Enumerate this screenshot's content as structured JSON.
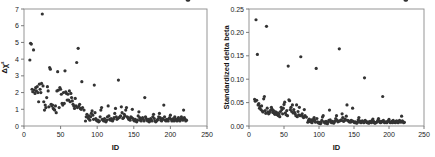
{
  "figure": {
    "background": "#ffffff",
    "marker_color": "#333333",
    "axis_color": "#6d6d6d",
    "panel_count": 2
  },
  "chart_data": [
    {
      "type": "scatter",
      "title": "",
      "xlabel": "ID",
      "ylabel": "Δχ²",
      "xlim": [
        0,
        250
      ],
      "ylim": [
        0,
        7
      ],
      "xticks": [
        0,
        50,
        100,
        150,
        200,
        250
      ],
      "yticks": [
        0,
        1,
        2,
        3,
        4,
        5,
        6,
        7
      ],
      "xtick_labels": [
        "0",
        "50",
        "100",
        "150",
        "200",
        "250"
      ],
      "ytick_labels": [
        "0",
        "1",
        "2",
        "3",
        "4",
        "5",
        "6",
        "7"
      ],
      "grid": false,
      "legend": false,
      "marker_size": 1.6,
      "marker_color": "#333333",
      "x": [
        8,
        9,
        10,
        11,
        12,
        13,
        14,
        15,
        16,
        17,
        18,
        19,
        20,
        21,
        22,
        23,
        24,
        25,
        26,
        27,
        28,
        29,
        30,
        31,
        32,
        33,
        34,
        35,
        36,
        37,
        38,
        39,
        40,
        41,
        42,
        43,
        44,
        45,
        46,
        47,
        48,
        49,
        50,
        51,
        52,
        53,
        54,
        55,
        56,
        57,
        58,
        59,
        60,
        61,
        62,
        63,
        64,
        65,
        66,
        67,
        68,
        69,
        70,
        71,
        72,
        73,
        74,
        75,
        76,
        77,
        78,
        79,
        80,
        82,
        84,
        85,
        86,
        87,
        88,
        89,
        90,
        91,
        92,
        93,
        94,
        95,
        96,
        97,
        98,
        99,
        100,
        101,
        102,
        103,
        104,
        105,
        106,
        107,
        108,
        109,
        110,
        111,
        112,
        113,
        114,
        115,
        116,
        117,
        118,
        119,
        120,
        121,
        122,
        123,
        124,
        125,
        126,
        127,
        128,
        129,
        130,
        131,
        132,
        133,
        134,
        135,
        136,
        137,
        138,
        139,
        140,
        141,
        142,
        143,
        144,
        145,
        146,
        147,
        148,
        149,
        150,
        151,
        152,
        153,
        154,
        155,
        156,
        157,
        158,
        159,
        160,
        161,
        162,
        163,
        164,
        165,
        166,
        167,
        168,
        169,
        170,
        171,
        172,
        173,
        174,
        175,
        176,
        177,
        178,
        179,
        180,
        181,
        182,
        183,
        184,
        185,
        186,
        187,
        188,
        189,
        190,
        191,
        192,
        193,
        194,
        195,
        196,
        197,
        198,
        199,
        200,
        201,
        202,
        203,
        204,
        205,
        206,
        207,
        208,
        209,
        210,
        211,
        212,
        213,
        214,
        215,
        216,
        217,
        218,
        219,
        220,
        221,
        222,
        223,
        224,
        225
      ],
      "y": [
        3.95,
        4.95,
        4.9,
        2.2,
        2.05,
        4.55,
        2.15,
        1.95,
        2.3,
        2.1,
        2.35,
        2.0,
        1.45,
        2.5,
        2.2,
        2.0,
        2.55,
        6.7,
        2.4,
        1.45,
        0.95,
        1.25,
        1.1,
        1.7,
        2.35,
        2.1,
        1.15,
        3.5,
        3.4,
        1.3,
        1.2,
        1.25,
        1.05,
        1.0,
        0.95,
        1.2,
        0.8,
        2.1,
        3.25,
        2.15,
        1.1,
        2.3,
        2.2,
        1.9,
        1.35,
        1.25,
        2.0,
        1.35,
        3.3,
        2.05,
        1.95,
        1.55,
        1.9,
        1.55,
        2.1,
        1.45,
        1.95,
        1.7,
        1.5,
        1.3,
        1.2,
        1.05,
        1.65,
        1.2,
        3.8,
        1.1,
        4.65,
        1.2,
        1.3,
        1.05,
        1.0,
        2.65,
        1.1,
        0.95,
        0.3,
        0.55,
        0.7,
        0.55,
        0.45,
        0.6,
        0.35,
        0.55,
        0.75,
        0.9,
        0.65,
        0.4,
        2.45,
        0.8,
        0.45,
        0.35,
        0.3,
        0.35,
        0.25,
        0.3,
        0.55,
        0.95,
        1.1,
        0.4,
        0.35,
        0.3,
        0.45,
        0.3,
        0.25,
        0.35,
        0.55,
        1.2,
        0.6,
        0.4,
        0.35,
        0.45,
        0.35,
        0.3,
        0.4,
        0.5,
        0.75,
        1.05,
        0.55,
        0.4,
        0.45,
        2.75,
        0.5,
        0.55,
        0.6,
        1.15,
        0.8,
        0.45,
        0.5,
        0.7,
        0.6,
        0.95,
        1.1,
        0.55,
        0.5,
        0.4,
        0.45,
        0.35,
        0.55,
        0.5,
        1.0,
        0.45,
        0.35,
        0.3,
        0.4,
        0.3,
        0.25,
        0.35,
        0.6,
        0.85,
        0.5,
        0.35,
        0.3,
        0.45,
        0.5,
        0.4,
        0.3,
        1.7,
        0.55,
        0.45,
        0.35,
        0.3,
        0.4,
        0.25,
        0.3,
        0.45,
        0.35,
        0.3,
        0.55,
        0.7,
        0.45,
        0.3,
        0.25,
        0.3,
        0.35,
        0.4,
        0.55,
        0.75,
        0.5,
        0.35,
        0.3,
        0.45,
        0.4,
        1.25,
        0.55,
        0.35,
        0.3,
        0.4,
        0.35,
        0.3,
        0.45,
        0.5,
        0.65,
        0.4,
        0.3,
        0.35,
        0.45,
        0.3,
        0.55,
        0.4,
        0.35,
        0.3,
        0.45,
        0.5,
        0.35,
        0.3,
        0.4,
        0.55,
        0.45,
        0.35,
        0.95,
        0.5,
        0.4,
        0.3,
        0.35
      ]
    },
    {
      "type": "scatter",
      "title": "",
      "xlabel": "ID",
      "ylabel": "Standardized delta beta",
      "xlim": [
        0,
        250
      ],
      "ylim": [
        0.0,
        0.25
      ],
      "xticks": [
        0,
        50,
        100,
        150,
        200,
        250
      ],
      "yticks": [
        0.0,
        0.05,
        0.1,
        0.15,
        0.2,
        0.25
      ],
      "xtick_labels": [
        "0",
        "50",
        "100",
        "150",
        "200",
        "250"
      ],
      "ytick_labels": [
        "0.00",
        "0.05",
        "0.10",
        "0.15",
        "0.20",
        "0.25"
      ],
      "grid": false,
      "legend": false,
      "marker_size": 1.6,
      "marker_color": "#333333",
      "x": [
        8,
        9,
        10,
        11,
        12,
        13,
        14,
        15,
        16,
        17,
        18,
        19,
        20,
        21,
        22,
        23,
        24,
        25,
        26,
        27,
        28,
        29,
        30,
        31,
        32,
        33,
        34,
        35,
        36,
        37,
        38,
        39,
        40,
        41,
        42,
        43,
        44,
        45,
        46,
        47,
        48,
        49,
        50,
        51,
        52,
        53,
        54,
        55,
        56,
        57,
        58,
        59,
        60,
        61,
        62,
        63,
        64,
        65,
        66,
        67,
        68,
        69,
        70,
        71,
        72,
        73,
        74,
        75,
        76,
        77,
        78,
        79,
        80,
        82,
        84,
        85,
        86,
        87,
        88,
        89,
        90,
        91,
        92,
        93,
        94,
        95,
        96,
        97,
        98,
        99,
        100,
        101,
        102,
        103,
        104,
        105,
        106,
        107,
        108,
        109,
        110,
        111,
        112,
        113,
        114,
        115,
        116,
        117,
        118,
        119,
        120,
        121,
        122,
        123,
        124,
        125,
        126,
        127,
        128,
        129,
        130,
        131,
        132,
        133,
        134,
        135,
        136,
        137,
        138,
        139,
        140,
        141,
        142,
        143,
        144,
        145,
        146,
        147,
        148,
        149,
        150,
        151,
        152,
        153,
        154,
        155,
        156,
        157,
        158,
        159,
        160,
        161,
        162,
        163,
        164,
        165,
        166,
        167,
        168,
        169,
        170,
        171,
        172,
        173,
        174,
        175,
        176,
        177,
        178,
        179,
        180,
        181,
        182,
        183,
        184,
        185,
        186,
        187,
        188,
        189,
        190,
        191,
        192,
        193,
        194,
        195,
        196,
        197,
        198,
        199,
        200,
        201,
        202,
        203,
        204,
        205,
        206,
        207,
        208,
        209,
        210,
        211,
        212,
        213,
        214,
        215,
        216,
        217,
        218,
        219,
        220,
        221,
        222,
        223,
        224,
        225
      ],
      "y": [
        0.057,
        0.053,
        0.227,
        0.055,
        0.153,
        0.045,
        0.048,
        0.038,
        0.042,
        0.035,
        0.043,
        0.032,
        0.03,
        0.058,
        0.063,
        0.033,
        0.027,
        0.213,
        0.038,
        0.03,
        0.026,
        0.028,
        0.031,
        0.034,
        0.04,
        0.036,
        0.029,
        0.033,
        0.027,
        0.025,
        0.03,
        0.026,
        0.024,
        0.028,
        0.022,
        0.026,
        0.02,
        0.031,
        0.04,
        0.035,
        0.026,
        0.038,
        0.046,
        0.051,
        0.028,
        0.024,
        0.033,
        0.022,
        0.128,
        0.056,
        0.054,
        0.035,
        0.04,
        0.031,
        0.045,
        0.028,
        0.035,
        0.029,
        0.026,
        0.022,
        0.045,
        0.02,
        0.031,
        0.024,
        0.04,
        0.022,
        0.148,
        0.023,
        0.026,
        0.02,
        0.018,
        0.035,
        0.022,
        0.019,
        0.008,
        0.012,
        0.015,
        0.01,
        0.009,
        0.013,
        0.007,
        0.011,
        0.014,
        0.018,
        0.012,
        0.008,
        0.123,
        0.016,
        0.009,
        0.007,
        0.006,
        0.008,
        0.005,
        0.007,
        0.012,
        0.019,
        0.022,
        0.009,
        0.008,
        0.006,
        0.01,
        0.007,
        0.005,
        0.008,
        0.012,
        0.034,
        0.013,
        0.009,
        0.007,
        0.01,
        0.008,
        0.006,
        0.009,
        0.011,
        0.016,
        0.022,
        0.012,
        0.009,
        0.01,
        0.165,
        0.011,
        0.012,
        0.013,
        0.026,
        0.018,
        0.01,
        0.011,
        0.015,
        0.013,
        0.021,
        0.045,
        0.012,
        0.011,
        0.009,
        0.01,
        0.008,
        0.012,
        0.011,
        0.038,
        0.01,
        0.008,
        0.007,
        0.009,
        0.007,
        0.006,
        0.008,
        0.013,
        0.018,
        0.011,
        0.008,
        0.007,
        0.01,
        0.011,
        0.009,
        0.007,
        0.103,
        0.012,
        0.01,
        0.008,
        0.007,
        0.009,
        0.006,
        0.007,
        0.01,
        0.008,
        0.007,
        0.012,
        0.015,
        0.01,
        0.007,
        0.006,
        0.007,
        0.008,
        0.009,
        0.012,
        0.016,
        0.011,
        0.008,
        0.007,
        0.01,
        0.009,
        0.063,
        0.012,
        0.008,
        0.007,
        0.009,
        0.008,
        0.007,
        0.01,
        0.011,
        0.014,
        0.009,
        0.007,
        0.008,
        0.01,
        0.007,
        0.012,
        0.009,
        0.008,
        0.007,
        0.01,
        0.011,
        0.008,
        0.007,
        0.009,
        0.012,
        0.01,
        0.008,
        0.021,
        0.011,
        0.009,
        0.007,
        0.008
      ]
    }
  ]
}
